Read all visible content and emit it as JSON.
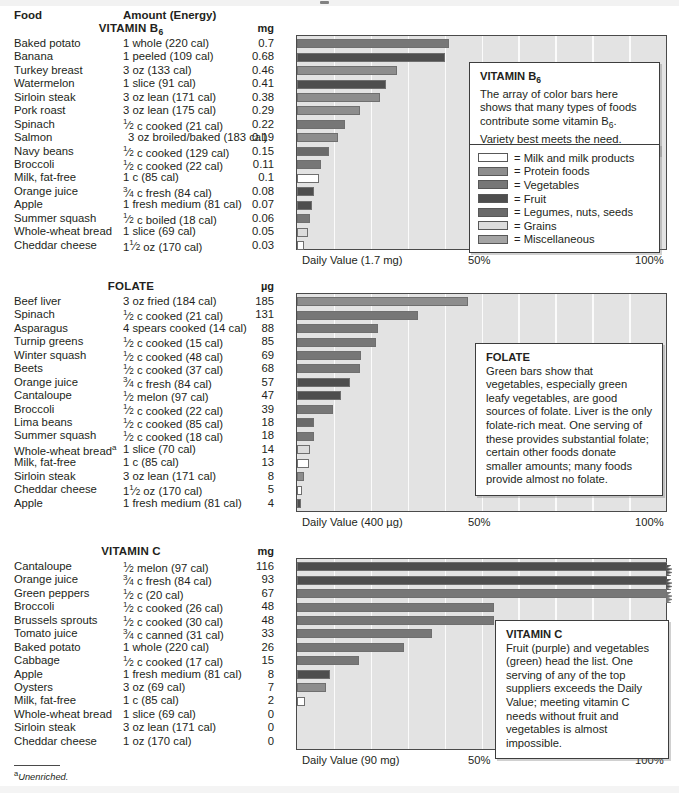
{
  "columns": {
    "food": "Food",
    "amount": "Amount (Energy)"
  },
  "footnote": {
    "marker": "a",
    "text": "Unenriched."
  },
  "legend": {
    "items": [
      {
        "label": "= Milk and milk products",
        "swatch_class": "sw-milk",
        "color": "#ffffff"
      },
      {
        "label": "= Protein foods",
        "swatch_class": "sw-prot",
        "color": "#8d8d8d"
      },
      {
        "label": "= Vegetables",
        "swatch_class": "sw-veg",
        "color": "#777777"
      },
      {
        "label": "= Fruit",
        "swatch_class": "sw-fruit",
        "color": "#4e4e4e"
      },
      {
        "label": "= Legumes, nuts, seeds",
        "swatch_class": "sw-leg",
        "color": "#6a6a6a"
      },
      {
        "label": "= Grains",
        "swatch_class": "sw-grain",
        "color": "#dcdcdc"
      },
      {
        "label": "= Miscellaneous",
        "swatch_class": "sw-misc",
        "color": "#a4a4a4"
      }
    ]
  },
  "axis_ticks": {
    "mid": "50%",
    "max": "100%"
  },
  "sections": {
    "b6": {
      "title": "VITAMIN B",
      "title_sub": "6",
      "unit": "mg",
      "daily_value_label": "Daily Value (1.7 mg)",
      "callout_title": "VITAMIN B",
      "callout_title_sub": "6",
      "callout_text_1": "The array of color bars here shows that many types of foods contribute some vitamin B",
      "callout_text_sub": "6",
      "callout_text_2": ". Variety best meets the need."
    },
    "folate": {
      "title": "FOLATE",
      "unit": "µg",
      "daily_value_label": "Daily Value (400 µg)",
      "callout_title": "FOLATE",
      "callout_text": "Green bars show that vegetables, especially green leafy vegetables, are good sources of folate. Liver is the only folate-rich meat. One serving of these provides substantial folate; certain other foods donate smaller amounts; many foods provide almost no folate."
    },
    "vitc": {
      "title": "VITAMIN C",
      "unit": "mg",
      "daily_value_label": "Daily Value (90 mg)",
      "callout_title": "VITAMIN C",
      "callout_text": "Fruit (purple) and vegetables (green) head the list. One serving of any of the top suppliers exceeds the Daily Value; meeting vitamin C needs without fruit and vegetables is almost impossible."
    }
  },
  "chart_data": [
    {
      "type": "bar",
      "id": "vitamin-b6",
      "title": "VITAMIN B6",
      "xlabel": "Daily Value (1.7 mg)",
      "ylabel": "",
      "unit": "mg",
      "daily_value": 1.7,
      "xlim": [
        0,
        100
      ],
      "xticks": [
        0,
        50,
        100
      ],
      "xticklabels": [
        "Daily Value (1.7 mg)",
        "50%",
        "100%"
      ],
      "grid": true,
      "orientation": "horizontal",
      "categories": [
        "Baked potato",
        "Banana",
        "Turkey breast",
        "Watermelon",
        "Sirloin steak",
        "Pork roast",
        "Spinach",
        "Salmon",
        "Navy beans",
        "Broccoli",
        "Milk, fat-free",
        "Orange juice",
        "Apple",
        "Summer squash",
        "Whole-wheat bread",
        "Cheddar cheese"
      ],
      "values": [
        0.7,
        0.68,
        0.46,
        0.41,
        0.38,
        0.29,
        0.22,
        0.19,
        0.15,
        0.11,
        0.1,
        0.08,
        0.07,
        0.06,
        0.05,
        0.03
      ],
      "percent_dv": [
        41.2,
        40.0,
        27.1,
        24.1,
        22.4,
        17.1,
        12.9,
        11.2,
        8.8,
        6.5,
        5.9,
        4.7,
        4.1,
        3.5,
        2.9,
        1.8
      ],
      "amounts": [
        "1 whole (220 cal)",
        "1 peeled (109 cal)",
        "3 oz (133 cal)",
        "1 slice (91 cal)",
        "3 oz lean (171 cal)",
        "3 oz lean (175 cal)",
        "1/2 c cooked (21 cal)",
        "3 oz broiled/baked (183 cal)",
        "1/2 c cooked (129 cal)",
        "1/2 c cooked (22 cal)",
        "1 c (85 cal)",
        "3/4 c fresh (84 cal)",
        "1 fresh medium (81 cal)",
        "1/2 c boiled (18 cal)",
        "1 slice (69 cal)",
        "1 1/2 oz (170 cal)"
      ],
      "food_groups": [
        "Vegetables",
        "Fruit",
        "Protein foods",
        "Fruit",
        "Protein foods",
        "Protein foods",
        "Vegetables",
        "Protein foods",
        "Legumes, nuts, seeds",
        "Vegetables",
        "Milk and milk products",
        "Fruit",
        "Fruit",
        "Vegetables",
        "Grains",
        "Milk and milk products"
      ]
    },
    {
      "type": "bar",
      "id": "folate",
      "title": "FOLATE",
      "xlabel": "Daily Value (400 µg)",
      "ylabel": "",
      "unit": "µg",
      "daily_value": 400,
      "xlim": [
        0,
        100
      ],
      "xticks": [
        0,
        50,
        100
      ],
      "xticklabels": [
        "Daily Value (400 µg)",
        "50%",
        "100%"
      ],
      "grid": true,
      "orientation": "horizontal",
      "categories": [
        "Beef liver",
        "Spinach",
        "Asparagus",
        "Turnip greens",
        "Winter squash",
        "Beets",
        "Orange juice",
        "Cantaloupe",
        "Broccoli",
        "Lima beans",
        "Summer squash",
        "Whole-wheat bread",
        "Milk, fat-free",
        "Sirloin steak",
        "Cheddar cheese",
        "Apple"
      ],
      "values": [
        185,
        131,
        88,
        85,
        69,
        68,
        57,
        47,
        39,
        18,
        18,
        14,
        13,
        8,
        5,
        4
      ],
      "percent_dv": [
        46.3,
        32.8,
        22.0,
        21.3,
        17.3,
        17.0,
        14.3,
        11.8,
        9.8,
        4.5,
        4.5,
        3.5,
        3.3,
        2.0,
        1.3,
        1.0
      ],
      "amounts": [
        "3 oz fried (184 cal)",
        "1/2 c cooked (21 cal)",
        "4 spears cooked (14 cal)",
        "1/2 c cooked (15 cal)",
        "1/2 c cooked (48 cal)",
        "1/2 c cooked (37 cal)",
        "3/4 c fresh (84 cal)",
        "1/2 melon (97 cal)",
        "1/2 c cooked (22 cal)",
        "1/2 c cooked (85 cal)",
        "1/2 c cooked (18 cal)",
        "1 slice (70 cal)",
        "1 c (85 cal)",
        "3 oz lean (171 cal)",
        "1 1/2 oz (170 cal)",
        "1 fresh medium (81 cal)"
      ],
      "food_notes": [
        "",
        "",
        "",
        "",
        "",
        "",
        "",
        "",
        "",
        "",
        "",
        "a",
        "",
        "",
        "",
        ""
      ],
      "food_groups": [
        "Protein foods",
        "Vegetables",
        "Vegetables",
        "Vegetables",
        "Vegetables",
        "Vegetables",
        "Fruit",
        "Fruit",
        "Vegetables",
        "Legumes, nuts, seeds",
        "Vegetables",
        "Grains",
        "Milk and milk products",
        "Protein foods",
        "Milk and milk products",
        "Fruit"
      ]
    },
    {
      "type": "bar",
      "id": "vitamin-c",
      "title": "VITAMIN C",
      "xlabel": "Daily Value (90 mg)",
      "ylabel": "",
      "unit": "mg",
      "daily_value": 90,
      "xlim": [
        0,
        100
      ],
      "xticks": [
        0,
        50,
        100
      ],
      "xticklabels": [
        "Daily Value (90 mg)",
        "50%",
        "100%"
      ],
      "grid": true,
      "orientation": "horizontal",
      "categories": [
        "Cantaloupe",
        "Orange juice",
        "Green peppers",
        "Broccoli",
        "Brussels sprouts",
        "Tomato juice",
        "Baked potato",
        "Cabbage",
        "Apple",
        "Oysters",
        "Milk, fat-free",
        "Whole-wheat bread",
        "Sirloin steak",
        "Cheddar cheese"
      ],
      "values": [
        116,
        93,
        67,
        48,
        48,
        33,
        26,
        15,
        8,
        7,
        2,
        0,
        0,
        0
      ],
      "percent_dv": [
        128.9,
        103.3,
        74.4,
        53.3,
        53.3,
        36.7,
        28.9,
        16.7,
        8.9,
        7.8,
        2.2,
        0,
        0,
        0
      ],
      "exceeds_scale": [
        true,
        true,
        true,
        false,
        false,
        false,
        false,
        false,
        false,
        false,
        false,
        false,
        false,
        false
      ],
      "amounts": [
        "1/2 melon (97 cal)",
        "3/4 c fresh (84 cal)",
        "1/2 c (20 cal)",
        "1/2 c cooked (26 cal)",
        "1/2 c cooked (30 cal)",
        "3/4 c canned (31 cal)",
        "1 whole (220 cal)",
        "1/2 c cooked (17 cal)",
        "1 fresh medium (81 cal)",
        "3 oz (69 cal)",
        "1 c (85 cal)",
        "1 slice (69 cal)",
        "3 oz lean (171 cal)",
        "1 oz (170 cal)"
      ],
      "food_groups": [
        "Fruit",
        "Fruit",
        "Vegetables",
        "Vegetables",
        "Vegetables",
        "Vegetables",
        "Vegetables",
        "Vegetables",
        "Fruit",
        "Protein foods",
        "Milk and milk products",
        "Grains",
        "Protein foods",
        "Milk and milk products"
      ]
    }
  ]
}
